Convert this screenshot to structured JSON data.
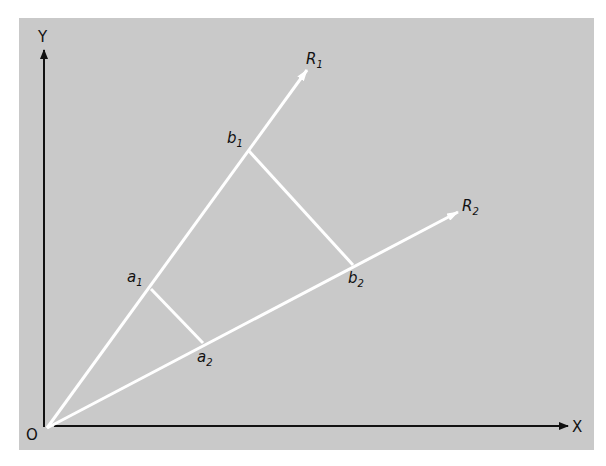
{
  "diagram": {
    "type": "vector-projection",
    "background_color": "#c9c9c9",
    "axes": {
      "origin_label": "O",
      "x_label": "X",
      "y_label": "Y",
      "color": "#111111"
    },
    "rays": [
      {
        "label": "R",
        "sub": "1",
        "color": "#ffffff"
      },
      {
        "label": "R",
        "sub": "2",
        "color": "#ffffff"
      }
    ],
    "points": [
      {
        "label": "a",
        "sub": "1",
        "on": "R1"
      },
      {
        "label": "a",
        "sub": "2",
        "on": "R2"
      },
      {
        "label": "b",
        "sub": "1",
        "on": "R1"
      },
      {
        "label": "b",
        "sub": "2",
        "on": "R2"
      }
    ],
    "connectors": [
      {
        "from": "a1",
        "to": "a2"
      },
      {
        "from": "b1",
        "to": "b2"
      }
    ]
  }
}
